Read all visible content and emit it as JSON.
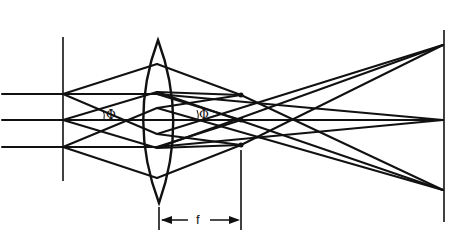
{
  "diagram": {
    "labels": {
      "angle_1": "Φ",
      "angle_2": "Φ",
      "focal_length": "f"
    },
    "colors": {
      "ink": "#111111",
      "background": "#ffffff"
    },
    "elements": [
      "incoming-parallel-beams",
      "source-plane",
      "convex-lens",
      "focal-plane-points",
      "screen-plane",
      "focal-length-dimension"
    ]
  }
}
